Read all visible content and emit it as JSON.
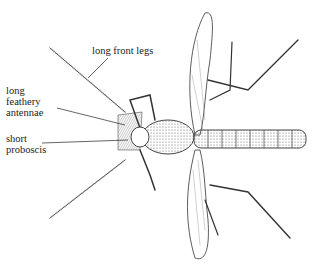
{
  "diagram": {
    "labels": [
      {
        "id": "front-legs",
        "text": "long front legs"
      },
      {
        "id": "antennae",
        "text": "long\nfeathery\nantennae"
      },
      {
        "id": "proboscis",
        "text": "short\nproboscis"
      }
    ]
  }
}
